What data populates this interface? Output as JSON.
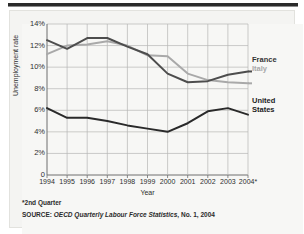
{
  "chart_data": {
    "type": "line",
    "title": "",
    "xlabel": "Year",
    "ylabel": "Unemployment rate",
    "x": [
      "1994",
      "1995",
      "1996",
      "1997",
      "1998",
      "1999",
      "2000",
      "2001",
      "2002",
      "2003",
      "2004*"
    ],
    "ylim": [
      0,
      14
    ],
    "ytick_labels": [
      "0",
      "2%",
      "4%",
      "6%",
      "8%",
      "10%",
      "12%",
      "14%"
    ],
    "ytick_values": [
      0,
      2,
      4,
      6,
      8,
      10,
      12,
      14
    ],
    "grid": true,
    "legend_position": "right",
    "series": [
      {
        "name": "France",
        "color": "#4d4d4d",
        "values": [
          12.5,
          11.7,
          12.7,
          12.7,
          11.9,
          11.2,
          9.4,
          8.6,
          8.7,
          9.3,
          9.6
        ]
      },
      {
        "name": "Italy",
        "color": "#a9a9a9",
        "values": [
          11.2,
          12.0,
          12.1,
          12.4,
          12.0,
          11.1,
          11.0,
          9.4,
          8.8,
          8.6,
          8.5
        ]
      },
      {
        "name": "United States",
        "color": "#2a2a2a",
        "values": [
          6.2,
          5.3,
          5.3,
          5.0,
          4.6,
          4.3,
          4.0,
          4.8,
          5.9,
          6.2,
          5.6
        ]
      }
    ],
    "annotations": [
      {
        "text": "*2nd Quarter"
      },
      {
        "text": "SOURCE: OECD Quarterly Labour Force Statistics, No. 1, 2004"
      }
    ]
  },
  "legend": {
    "france": "France",
    "italy": "Italy",
    "united": "United",
    "states": "States"
  },
  "axis": {
    "y_title": "Unemployment rate",
    "x_title": "Year"
  },
  "notes": {
    "footnote": "*2nd Quarter",
    "source_prefix": "SOURCE: ",
    "source_title": "OECD Quarterly Labour Force Statistics",
    "source_suffix": ", No. 1, 2004"
  },
  "colors": {
    "france": "#4d4d4d",
    "italy": "#a9a9a9",
    "united_states": "#2a2a2a",
    "grid": "#b6b6b4",
    "panel": "#f4f4f2"
  }
}
